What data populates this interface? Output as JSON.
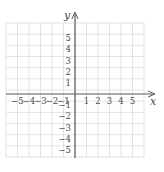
{
  "diagram": {
    "type": "coordinate-plane",
    "x_axis": {
      "label": "x",
      "min": -6,
      "max": 6,
      "tick_labels": [
        "-5",
        "-4",
        "-3",
        "-2",
        "-1",
        "1",
        "2",
        "3",
        "4",
        "5"
      ]
    },
    "y_axis": {
      "label": "y",
      "min": -6,
      "max": 6,
      "tick_labels": [
        "5",
        "4",
        "3",
        "2",
        "1",
        "-1",
        "-2",
        "-3",
        "-4",
        "-5"
      ]
    },
    "grid": {
      "on": true,
      "cells_x": 12,
      "cells_y": 12
    },
    "colors": {
      "grid": "#dcdcdc",
      "axis": "#5a5a5a",
      "text": "#4a4a4a",
      "background": "#ffffff"
    }
  },
  "labels": {
    "x": "x",
    "y": "y",
    "xneg": [
      "−5",
      "−4",
      "−3",
      "−2",
      "−1"
    ],
    "xpos": [
      "1",
      "2",
      "3",
      "4",
      "5"
    ],
    "ypos": [
      "5",
      "4",
      "3",
      "2",
      "1"
    ],
    "yneg": [
      "−1",
      "−2",
      "−3",
      "−4",
      "−5"
    ]
  }
}
